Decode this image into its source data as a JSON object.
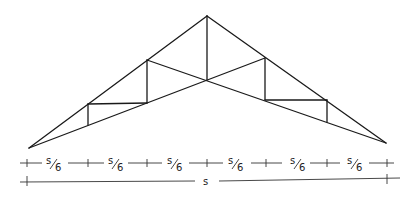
{
  "diagram": {
    "type": "scissor-truss",
    "colors": {
      "line": "#1a1a1a",
      "dimension": "#333333",
      "background": "#ffffff"
    },
    "nodes": {
      "left_support": [
        29,
        148
      ],
      "left_top_1": [
        88,
        104
      ],
      "left_bot_1": [
        88,
        125
      ],
      "left_top_2": [
        147,
        60
      ],
      "left_bot_2": [
        147,
        103
      ],
      "apex": [
        207,
        16
      ],
      "center_bottom": [
        207,
        80
      ],
      "right_top_2": [
        265,
        58
      ],
      "right_bot_2": [
        265,
        100
      ],
      "right_top_1": [
        327,
        100
      ],
      "right_bot_1": [
        327,
        122
      ],
      "right_support": [
        386,
        143
      ]
    },
    "dimensions": {
      "panel_label": "s/6",
      "panel_label_num": "s",
      "panel_label_den": "6",
      "panel_count": 6,
      "total_label": "s",
      "tick_x": [
        27,
        88,
        147,
        207,
        266,
        327,
        387
      ]
    }
  }
}
